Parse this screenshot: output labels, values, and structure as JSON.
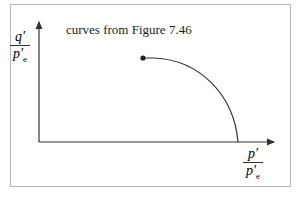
{
  "diagram": {
    "title": "curves from Figure 7.46",
    "y_axis_label": {
      "numerator": "q′",
      "denominator": "p′",
      "denominator_sub": "e"
    },
    "x_axis_label": {
      "numerator": "p′",
      "denominator": "p′",
      "denominator_sub": "e"
    },
    "curve": {
      "start_point": "filled dot",
      "shape": "quarter-ellipse descending to x-axis"
    },
    "colors": {
      "axes": "#333333",
      "frame": "#b8b8b8",
      "curve": "#333333"
    }
  }
}
